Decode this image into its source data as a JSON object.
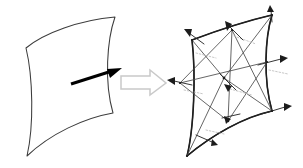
{
  "figure": {
    "background_color": "#ffffff",
    "width": 303,
    "height": 168,
    "panels": [
      {
        "id": "smooth-surface-panel",
        "label": "Smooth curved surface patch with single normal vector",
        "outline_color": "#3c3c3c",
        "fill_color": "#ffffff"
      },
      {
        "id": "mesh-surface-panel",
        "label": "Triangulated mesh approximation with per-vertex normal vectors",
        "outline_color": "#2e2e2e",
        "edge_color": "#4a4a4a",
        "fill_color": "#ffffff"
      }
    ]
  },
  "smooth_surface": {
    "name": "curved-quadrilateral-patch",
    "corners": {
      "top_left": [
        26,
        48
      ],
      "top_right": [
        115,
        17
      ],
      "bottom_right": [
        113,
        113
      ],
      "bottom_left": [
        27,
        156
      ]
    },
    "outline_path": "M26,48 C44,33 80,20 115,17 C107,40 104,82 113,113 C84,118 50,134 27,156 C34,126 33,77 26,48 Z",
    "normal_vector": {
      "name": "surface-normal-arrow",
      "from": [
        71,
        84
      ],
      "to": [
        120,
        69
      ],
      "color": "#000000",
      "thickness": 2.9
    }
  },
  "transform_arrow": {
    "name": "block-arrow-right",
    "label": "discretization step",
    "direction": "right",
    "outline_color": "#c9c9c9",
    "fill_color": "#ffffff",
    "path": "M121,76 L150,76 L150,70 L166,83 L150,95 L150,89 L121,89 Z"
  },
  "mesh_surface": {
    "name": "triangulated-mesh-patch",
    "corners": {
      "top_left": [
        192,
        40
      ],
      "top_right": [
        272,
        15
      ],
      "bottom_right": [
        272,
        111
      ],
      "bottom_left": [
        187,
        156
      ]
    },
    "outline_path": "M192,40 C216,31 246,21 272,15 C265,38 263,79 272,111 C244,117 212,135 187,156 C194,128 196,74 192,40 Z",
    "rim_path": "M192,40 C216,31 246,21 272,15 M272,15 C265,38 263,79 272,111 M272,111 C244,117 212,135 187,156 M187,156 C194,128 196,74 192,40",
    "grid": {
      "rows": 2,
      "cols": 2,
      "vertex_count": 9,
      "triangle_count": 8
    },
    "vertices": [
      {
        "id": "v-top-left",
        "x": 192,
        "y": 40,
        "normal_to": [
          185,
          29
        ]
      },
      {
        "id": "v-top-mid",
        "x": 232,
        "y": 30,
        "normal_to": [
          228,
          18
        ]
      },
      {
        "id": "v-top-right",
        "x": 272,
        "y": 15,
        "normal_to": [
          270,
          4
        ]
      },
      {
        "id": "v-mid-left",
        "x": 180,
        "y": 83,
        "normal_to": [
          168,
          80
        ]
      },
      {
        "id": "v-center",
        "x": 224,
        "y": 78,
        "normal_to": [
          216,
          68
        ]
      },
      {
        "id": "v-mid-right",
        "x": 267,
        "y": 62,
        "normal_to": [
          285,
          58
        ]
      },
      {
        "id": "v-bottom-left",
        "x": 187,
        "y": 156,
        "normal_to": [
          178,
          148
        ]
      },
      {
        "id": "v-bottom-mid",
        "x": 228,
        "y": 121,
        "normal_to": [
          212,
          112
        ]
      },
      {
        "id": "v-bottom-right",
        "x": 272,
        "y": 111,
        "normal_to": [
          290,
          107
        ]
      }
    ],
    "interior_edges": [
      {
        "id": "edge-h-mid",
        "from": [
          180,
          83
        ],
        "to": [
          267,
          62
        ]
      },
      {
        "id": "edge-v-mid",
        "from": [
          232,
          30
        ],
        "to": [
          228,
          121
        ]
      },
      {
        "id": "edge-diag-1",
        "from": [
          192,
          40
        ],
        "to": [
          224,
          78
        ]
      },
      {
        "id": "edge-diag-2",
        "from": [
          272,
          15
        ],
        "to": [
          224,
          78
        ]
      },
      {
        "id": "edge-diag-3",
        "from": [
          180,
          83
        ],
        "to": [
          228,
          121
        ]
      },
      {
        "id": "edge-diag-4",
        "from": [
          224,
          78
        ],
        "to": [
          272,
          111
        ]
      },
      {
        "id": "edge-diag-5",
        "from": [
          187,
          156
        ],
        "to": [
          224,
          78
        ]
      },
      {
        "id": "edge-diag-6",
        "from": [
          232,
          30
        ],
        "to": [
          180,
          83
        ]
      },
      {
        "id": "edge-diag-7",
        "from": [
          267,
          62
        ],
        "to": [
          228,
          121
        ]
      },
      {
        "id": "edge-diag-8",
        "from": [
          272,
          111
        ],
        "to": [
          232,
          30
        ]
      }
    ],
    "normals": {
      "label": "per-vertex normal vectors",
      "color": "#2b2b2b",
      "ghost_color": "#b9b9b9"
    }
  }
}
